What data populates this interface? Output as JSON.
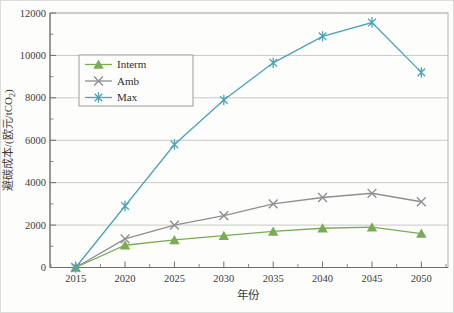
{
  "chart_data": {
    "type": "line",
    "title": "",
    "xlabel": "年份",
    "ylabel": "避碳成本/(欧元/tCO₂)",
    "ylabel_parts": {
      "main": "避碳成本/(欧元/tCO",
      "sub": "2",
      "end": ")"
    },
    "x": [
      2015,
      2020,
      2025,
      2030,
      2035,
      2040,
      2045,
      2050
    ],
    "xlim": [
      2012.4,
      2052.7
    ],
    "ylim": [
      0,
      12000
    ],
    "yticks": [
      0,
      2000,
      4000,
      6000,
      8000,
      10000,
      12000
    ],
    "y_minor_ticks": [
      1000,
      3000,
      5000,
      7000,
      9000,
      11000
    ],
    "x_minor_ticks": [
      2012.5,
      2017.5,
      2022.5,
      2027.5,
      2032.5,
      2037.5,
      2042.5,
      2047.5,
      2052.5
    ],
    "grid": "horizontal-major-only",
    "legend_position": "upper-left-inside",
    "series": [
      {
        "name": "Interm",
        "marker": "triangle",
        "color": "#79ad52",
        "values": [
          0,
          1050,
          1300,
          1500,
          1700,
          1850,
          1900,
          1600
        ]
      },
      {
        "name": "Amb",
        "marker": "x",
        "color": "#8f8f93",
        "values": [
          0,
          1350,
          2000,
          2450,
          3000,
          3300,
          3500,
          3100
        ]
      },
      {
        "name": "Max",
        "marker": "asterisk",
        "color": "#4aa4ba",
        "values": [
          0,
          2900,
          5800,
          7900,
          9650,
          10900,
          11550,
          9200
        ]
      }
    ]
  },
  "style": {
    "background": "#fdfdfb",
    "frame_color": "#b3b3b0",
    "grid_color": "#c8c8c4",
    "axis_color": "#6e6e6b",
    "text_color": "#3c3c3a",
    "legend_border": "#9c9c99",
    "legend_fill": "#fdfdfb"
  }
}
